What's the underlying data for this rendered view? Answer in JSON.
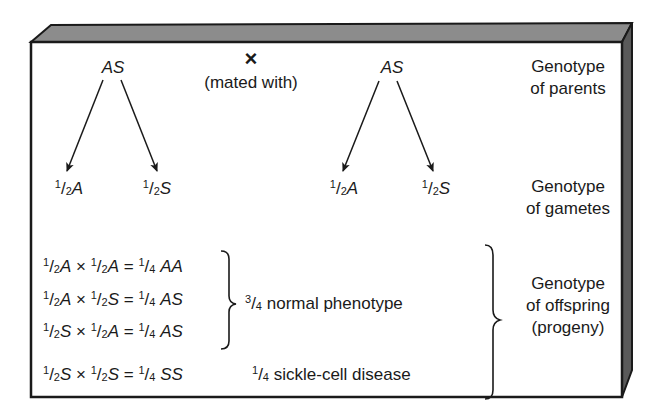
{
  "parents": {
    "left": "AS",
    "right": "AS",
    "cross_symbol": "×",
    "cross_caption": "(mated with)"
  },
  "gametes": [
    {
      "num": "1",
      "den": "2",
      "allele": "A"
    },
    {
      "num": "1",
      "den": "2",
      "allele": "S"
    },
    {
      "num": "1",
      "den": "2",
      "allele": "A"
    },
    {
      "num": "1",
      "den": "2",
      "allele": "S"
    }
  ],
  "labels": {
    "parents_line1": "Genotype",
    "parents_line2": "of parents",
    "gametes_line1": "Genotype",
    "gametes_line2": "of gametes",
    "offspring_line1": "Genotype",
    "offspring_line2": "of offspring",
    "offspring_line3": "(progeny)"
  },
  "offspring": [
    {
      "a": "A",
      "b": "A",
      "result_num": "1",
      "result_den": "4",
      "genotype": "AA"
    },
    {
      "a": "A",
      "b": "S",
      "result_num": "1",
      "result_den": "4",
      "genotype": "AS"
    },
    {
      "a": "S",
      "b": "A",
      "result_num": "1",
      "result_den": "4",
      "genotype": "AS"
    },
    {
      "a": "S",
      "b": "S",
      "result_num": "1",
      "result_den": "4",
      "genotype": "SS"
    }
  ],
  "equation_parts": {
    "half_num": "1",
    "half_den": "2",
    "times": "×",
    "equals": "="
  },
  "phenotypes": {
    "normal": {
      "num": "3",
      "den": "4",
      "text": "normal phenotype"
    },
    "disease": {
      "num": "1",
      "den": "4",
      "text": "sickle-cell disease"
    }
  },
  "colors": {
    "ink": "#1a1a1a",
    "bevel_top": "#8c8c8c",
    "bevel_side": "#5a5a5a",
    "face": "#ffffff"
  }
}
